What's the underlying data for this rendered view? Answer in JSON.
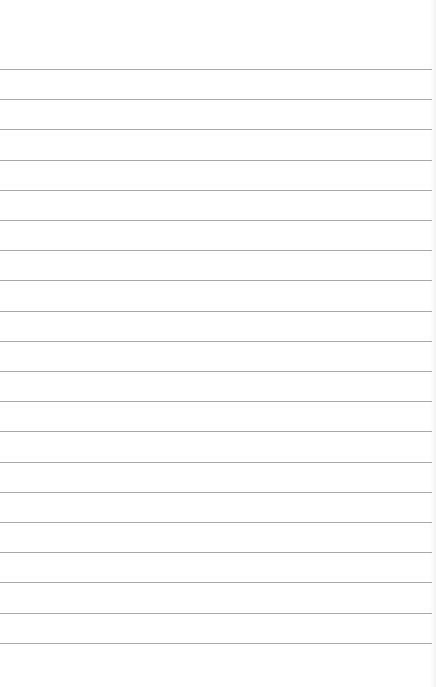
{
  "page": {
    "type": "lined-paper",
    "background": "#ffffff",
    "rule_color": "#a0a0a0",
    "rule_count": 20,
    "first_rule_y": 69,
    "rule_spacing": 30.2,
    "rule_width": 432,
    "text": ""
  }
}
